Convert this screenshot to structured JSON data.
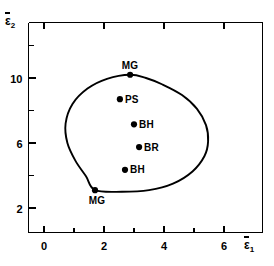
{
  "chart_data": {
    "type": "scatter",
    "title": "",
    "xlabel": "ε̅1",
    "ylabel": "ε̅2",
    "xlim": [
      -0.45,
      7.6
    ],
    "ylim": [
      0.1,
      13.2
    ],
    "xticks_major": [
      0,
      2,
      4,
      6
    ],
    "xticks_major_labels": [
      "0",
      "2",
      "4",
      "6"
    ],
    "xticks_minor": [
      1,
      3,
      5
    ],
    "yticks_major": [
      2,
      6,
      10
    ],
    "yticks_major_labels": [
      "2",
      "6",
      "10"
    ],
    "yticks_minor": [
      4,
      8,
      12
    ],
    "grid": false,
    "legend": "none",
    "points": [
      {
        "label": "MG",
        "x": 2.87,
        "y": 10.2,
        "label_pos": "above"
      },
      {
        "label": "PS",
        "x": 2.53,
        "y": 8.7,
        "label_pos": "right"
      },
      {
        "label": "BH",
        "x": 3.0,
        "y": 7.15,
        "label_pos": "right"
      },
      {
        "label": "BR",
        "x": 3.17,
        "y": 5.75,
        "label_pos": "right"
      },
      {
        "label": "BH",
        "x": 2.7,
        "y": 4.35,
        "label_pos": "right"
      },
      {
        "label": "MG",
        "x": 1.7,
        "y": 3.1,
        "label_pos": "below-left"
      }
    ],
    "envelope": {
      "name": "enclosing-envelope",
      "closed": true,
      "vertices": [
        [
          2.87,
          10.2
        ],
        [
          2.1,
          9.95
        ],
        [
          1.45,
          9.35
        ],
        [
          0.95,
          8.4
        ],
        [
          0.72,
          7.2
        ],
        [
          0.78,
          6.0
        ],
        [
          1.05,
          4.9
        ],
        [
          1.4,
          3.95
        ],
        [
          1.7,
          3.1
        ],
        [
          2.6,
          3.0
        ],
        [
          3.5,
          3.1
        ],
        [
          4.3,
          3.5
        ],
        [
          4.95,
          4.25
        ],
        [
          5.35,
          5.2
        ],
        [
          5.47,
          6.1
        ],
        [
          5.4,
          7.1
        ],
        [
          5.1,
          8.1
        ],
        [
          4.6,
          8.95
        ],
        [
          3.95,
          9.6
        ],
        [
          3.4,
          10.0
        ]
      ]
    },
    "colors": {
      "axis": "#000000",
      "curve": "#000000",
      "marker": "#000000",
      "background": "#ffffff"
    }
  }
}
